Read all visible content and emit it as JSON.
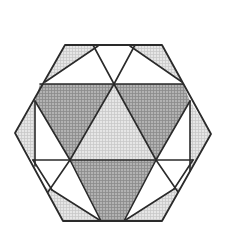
{
  "figure": {
    "colors": {
      "dark": "#a4a4a4",
      "light": "#dedede",
      "line": "#2a2a2a",
      "background": "#ffffff"
    },
    "regions": [
      {
        "name": "dark-triangle-upper-left",
        "shade": "dark"
      },
      {
        "name": "dark-triangle-upper-right",
        "shade": "dark"
      },
      {
        "name": "dark-triangle-bottom",
        "shade": "dark"
      },
      {
        "name": "light-triangle-center",
        "shade": "light"
      },
      {
        "name": "light-corner-top-left",
        "shade": "light"
      },
      {
        "name": "light-corner-top-right",
        "shade": "light"
      },
      {
        "name": "light-corner-left",
        "shade": "light"
      },
      {
        "name": "light-corner-right",
        "shade": "light"
      },
      {
        "name": "light-corner-bottom-left",
        "shade": "light"
      },
      {
        "name": "light-corner-bottom-right",
        "shade": "light"
      }
    ]
  }
}
